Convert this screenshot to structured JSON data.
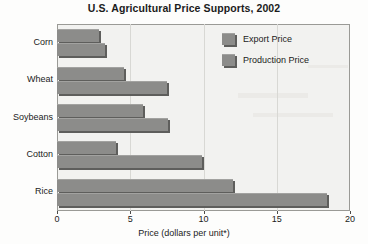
{
  "chart_data": {
    "type": "bar",
    "orientation": "horizontal",
    "title": "U.S. Agricultural Price Supports, 2002",
    "xlabel": "Price (dollars per unit*)",
    "ylabel": "",
    "categories": [
      "Corn",
      "Wheat",
      "Soybeans",
      "Cotton",
      "Rice"
    ],
    "series": [
      {
        "name": "Export Price",
        "values": [
          2.9,
          4.6,
          5.9,
          4.0,
          12.0
        ],
        "color": "#8c8c8a"
      },
      {
        "name": "Production Price",
        "values": [
          3.3,
          7.5,
          7.6,
          9.9,
          18.4
        ],
        "color": "#8c8c8a"
      }
    ],
    "xlim": [
      0,
      20
    ],
    "xticks": [
      0,
      5,
      10,
      15,
      20
    ],
    "xtick_labels": [
      "0",
      "5",
      "10",
      "15",
      "20"
    ],
    "grid": true,
    "grid_axis": "x",
    "legend_position": "top-right",
    "plot_background": "#f2f2f0",
    "frame_color": "#9a9a96",
    "bar_shadow_color": "#5e5e5c"
  }
}
